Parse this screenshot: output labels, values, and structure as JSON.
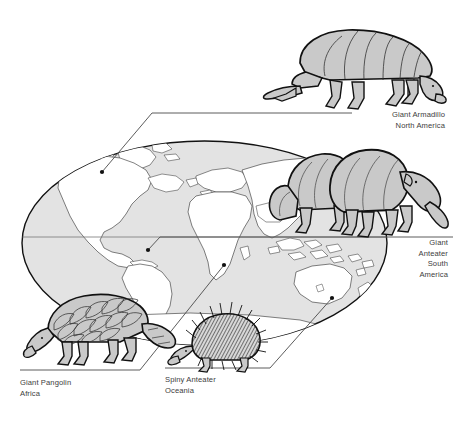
{
  "figure": {
    "type": "illustrated-world-map",
    "background_color": "#ffffff",
    "ink_color": "#1a1a1a",
    "ocean_color": "#e3e3e3",
    "land_color": "#ffffff",
    "animal_fill_color": "#c9c9c9",
    "text_color": "#3d3d3d"
  },
  "callouts": [
    {
      "id": "armadillo",
      "animal": "Giant Armadillo",
      "region": "North America",
      "align": "right",
      "marker": {
        "x": 102,
        "y": 172
      },
      "leader": [
        [
          102,
          172
        ],
        [
          152,
          113
        ],
        [
          352,
          113
        ]
      ],
      "rule_y": 113
    },
    {
      "id": "anteater",
      "animal_line1": "Giant",
      "animal_line2": "Anteater",
      "region_line1": "South",
      "region_line2": "America",
      "align": "right",
      "marker": {
        "x": 148,
        "y": 250
      },
      "leader": [
        [
          148,
          250
        ],
        [
          160,
          237
        ],
        [
          453,
          237
        ]
      ],
      "rule_y": 237
    },
    {
      "id": "pangolin",
      "animal": "Giant Pangolin",
      "region": "Africa",
      "align": "left",
      "marker": {
        "x": 224,
        "y": 265
      },
      "leader": [
        [
          224,
          265
        ],
        [
          140,
          370
        ],
        [
          20,
          370
        ]
      ],
      "rule_y": 370
    },
    {
      "id": "echidna",
      "animal": "Spiny Anteater",
      "region": "Oceania",
      "align": "left",
      "marker": {
        "x": 332,
        "y": 298
      },
      "leader": [
        [
          332,
          298
        ],
        [
          270,
          368
        ],
        [
          165,
          368
        ]
      ],
      "rule_y": 368
    }
  ],
  "globe": {
    "shape": "oval",
    "left": 22,
    "right": 387,
    "top": 141,
    "bottom": 345,
    "equator_y": 237,
    "continents_shown": [
      "North America",
      "South America",
      "Greenland",
      "Europe",
      "Africa",
      "Asia",
      "Australia",
      "New Zealand",
      "Indonesia",
      "Madagascar",
      "Antarctica"
    ]
  },
  "animals": [
    {
      "id": "armadillo",
      "name": "Giant Armadillo",
      "facing": "right",
      "position": "top-right",
      "texture": "banded-shell"
    },
    {
      "id": "anteater-front",
      "name": "Giant Anteater",
      "facing": "right",
      "position": "over-asia",
      "texture": "smooth-long-snout"
    },
    {
      "id": "anteater-back",
      "name": "Giant Anteater",
      "facing": "right",
      "position": "over-asia",
      "texture": "smooth-long-snout"
    },
    {
      "id": "pangolin",
      "name": "Giant Pangolin",
      "facing": "left",
      "position": "bottom-left",
      "texture": "overlapping-scales"
    },
    {
      "id": "echidna",
      "name": "Spiny Anteater",
      "facing": "left",
      "position": "bottom-center",
      "texture": "spines"
    }
  ]
}
